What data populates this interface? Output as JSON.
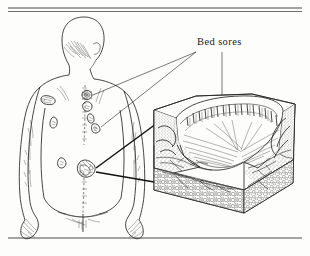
{
  "figure": {
    "label": "Bed sores",
    "label_x": 197,
    "label_y": 44,
    "background_color": "#fdfdfb",
    "ink_color": "#2b2b2b",
    "rules": {
      "top_line_1_y": 8,
      "top_line_2_y": 12,
      "bottom_line_y": 238,
      "left_x": 8,
      "right_x": 302
    },
    "body_figure": {
      "name": "posterior view of human torso",
      "view": "back",
      "features": [
        "head",
        "neck",
        "shoulders",
        "back",
        "spine",
        "arms",
        "hands",
        "buttocks"
      ]
    },
    "sores": [
      {
        "id": "upper-spine",
        "cx": 87,
        "cy": 95,
        "rx": 5,
        "ry": 4.5
      },
      {
        "id": "left-scapula",
        "cx": 48,
        "cy": 100,
        "rx": 7,
        "ry": 3.5
      },
      {
        "id": "mid-spine",
        "cx": 88,
        "cy": 106,
        "rx": 4,
        "ry": 4
      },
      {
        "id": "left-flank",
        "cx": 55,
        "cy": 122,
        "rx": 3,
        "ry": 5
      },
      {
        "id": "right-upper",
        "cx": 91,
        "cy": 118,
        "rx": 3,
        "ry": 4.5
      },
      {
        "id": "right-lower",
        "cx": 96,
        "cy": 128,
        "rx": 4,
        "ry": 4
      },
      {
        "id": "lumbar-left",
        "cx": 62,
        "cy": 163,
        "rx": 4,
        "ry": 5
      },
      {
        "id": "sacral",
        "cx": 86,
        "cy": 170,
        "rx": 9,
        "ry": 9
      }
    ],
    "leaders": [
      {
        "id": "leader-to-upper-spine",
        "from_x": 196,
        "from_y": 52,
        "to_x": 93,
        "to_y": 95
      },
      {
        "id": "leader-to-right-sore",
        "from_x": 196,
        "from_y": 52,
        "to_x": 100,
        "to_y": 127
      },
      {
        "id": "leader-to-crater",
        "from_x": 222,
        "from_y": 52,
        "to_x": 222,
        "to_y": 145
      },
      {
        "id": "leader-block-upper",
        "from_x": 162,
        "from_y": 120,
        "to_x": 95,
        "to_y": 168
      },
      {
        "id": "leader-block-lower",
        "from_x": 162,
        "from_y": 182,
        "to_x": 95,
        "to_y": 172
      }
    ],
    "cross_section": {
      "name": "magnified tissue block",
      "layers": [
        "epidermis",
        "dermis",
        "subcutaneous fat"
      ],
      "features": [
        "ulcer crater",
        "undermined edges",
        "blood vessels",
        "granulation floor"
      ],
      "box": {
        "x": 150,
        "y": 88,
        "width": 145,
        "height": 125
      }
    }
  }
}
